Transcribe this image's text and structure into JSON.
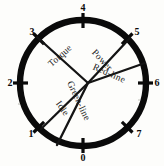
{
  "figure": {
    "name": "engine-operating-dial",
    "shape": "circle",
    "stroke_color": "#0a0a0a",
    "background_color": "#fdfdfb"
  },
  "dial": {
    "center_x": 83,
    "center_y": 83,
    "radius": 63,
    "hub_x": 88,
    "hub_y": 83
  },
  "ticks": [
    {
      "label": "4",
      "angle_deg": 90,
      "label_x": 83,
      "label_y": 11
    },
    {
      "label": "5",
      "angle_deg": 45,
      "label_x": 137,
      "label_y": 35
    },
    {
      "label": "6",
      "angle_deg": 0,
      "label_x": 157,
      "label_y": 86
    },
    {
      "label": "7",
      "angle_deg": -45,
      "label_x": 139,
      "label_y": 137
    },
    {
      "label": "0",
      "angle_deg": -90,
      "label_x": 83,
      "label_y": 161
    },
    {
      "label": "1",
      "angle_deg": -135,
      "label_x": 31,
      "label_y": 137
    },
    {
      "label": "2",
      "angle_deg": 180,
      "label_x": 10,
      "label_y": 86
    },
    {
      "label": "3",
      "angle_deg": 135,
      "label_x": 32,
      "label_y": 35
    }
  ],
  "spokes": [
    {
      "name": "torque",
      "label": "Torque",
      "to_x": 37,
      "to_y": 37,
      "text_x": 62,
      "text_y": 58,
      "text_rotation": -42
    },
    {
      "name": "power",
      "label": "Power",
      "to_x": 130,
      "to_y": 38,
      "text_x": 100,
      "text_y": 62,
      "text_rotation": 47
    },
    {
      "name": "red-line",
      "label": "Red-line",
      "to_x": 145,
      "to_y": 63,
      "text_x": 108,
      "text_y": 76,
      "text_rotation": 24
    },
    {
      "name": "idle",
      "label": "Idle",
      "to_x": 41,
      "to_y": 129,
      "text_x": 60,
      "text_y": 110,
      "text_rotation": 55
    },
    {
      "name": "green-line",
      "label": "Green-line",
      "to_x": 57,
      "to_y": 145,
      "text_x": 76,
      "text_y": 102,
      "text_rotation": 65
    }
  ],
  "legend": {
    "title": "Engine speed dial",
    "units": "thousand rpm"
  }
}
